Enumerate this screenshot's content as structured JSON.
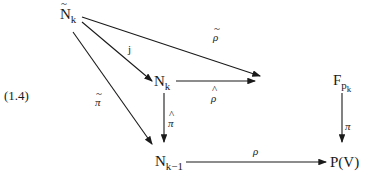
{
  "diagram": {
    "top_fragment": "F_k",
    "equation_label": "(1.4)",
    "nodes": {
      "n_tilde_k": {
        "base": "N",
        "accent": "~",
        "sub": "k"
      },
      "n_k": {
        "base": "N",
        "sub": "k"
      },
      "f_pk": {
        "base": "F",
        "sub": "p",
        "subsub": "k"
      },
      "n_k_minus_1": {
        "base": "N",
        "sub": "k−1"
      },
      "p_v": {
        "text": "P(V)"
      }
    },
    "arrows": [
      {
        "from": "N~_k",
        "to": "N_k",
        "label": "j"
      },
      {
        "from": "N~_k",
        "to": "F_pk",
        "label": "ρ~",
        "label_base": "ρ",
        "accent": "~"
      },
      {
        "from": "N~_k",
        "to": "N_k-1",
        "label": "π~",
        "label_base": "π",
        "accent": "~"
      },
      {
        "from": "N_k",
        "to": "F_pk",
        "label": "ρ^",
        "label_base": "ρ",
        "accent": "^"
      },
      {
        "from": "N_k",
        "to": "N_k-1",
        "label": "π^",
        "label_base": "π",
        "accent": "^"
      },
      {
        "from": "F_pk",
        "to": "P(V)",
        "label": "π"
      },
      {
        "from": "N_k-1",
        "to": "P(V)",
        "label": "ρ"
      }
    ]
  }
}
